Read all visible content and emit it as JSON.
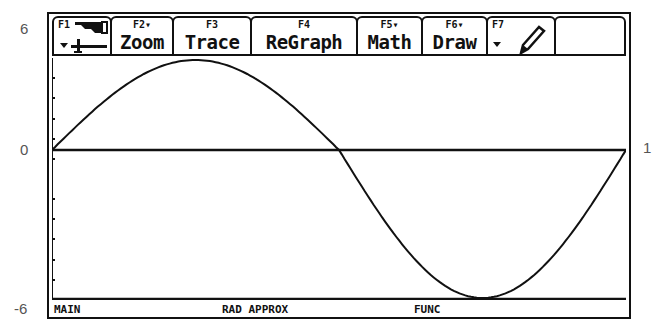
{
  "axis_labels": {
    "y_top": "6",
    "y_zero": "0",
    "y_bottom": "-6",
    "x_right": "1"
  },
  "toolbar": {
    "keys": [
      {
        "fn": "F1",
        "label": "",
        "icon": "tools-menu-icon"
      },
      {
        "fn": "F2▾",
        "label": "Zoom"
      },
      {
        "fn": "F3",
        "label": "Trace"
      },
      {
        "fn": "F4",
        "label": "ReGraph"
      },
      {
        "fn": "F5▾",
        "label": "Math"
      },
      {
        "fn": "F6▾",
        "label": "Draw"
      },
      {
        "fn": "F7",
        "label": "",
        "icon": "pencil-icon"
      },
      {
        "fn": "",
        "label": ""
      }
    ]
  },
  "status_bar": {
    "folder": "MAIN",
    "mode": "RAD APPROX",
    "graph_mode": "FUNC"
  },
  "colors": {
    "ink": "#111111",
    "background": "#ffffff",
    "label_gray": "#555555"
  },
  "chart_data": {
    "type": "line",
    "title": "",
    "xlabel": "",
    "ylabel": "",
    "function": "y = 6 sin(2πx)",
    "xlim": [
      0,
      1
    ],
    "ylim": [
      -6,
      6
    ],
    "yticks": [
      -6,
      0,
      6
    ],
    "xticks": [
      0,
      1
    ],
    "grid": false,
    "series": [
      {
        "name": "y1",
        "x": [
          0,
          0.125,
          0.25,
          0.375,
          0.5,
          0.625,
          0.75,
          0.875,
          1
        ],
        "values": [
          0,
          4.24,
          6,
          4.24,
          0,
          -4.24,
          -6,
          -4.24,
          0
        ]
      }
    ]
  }
}
